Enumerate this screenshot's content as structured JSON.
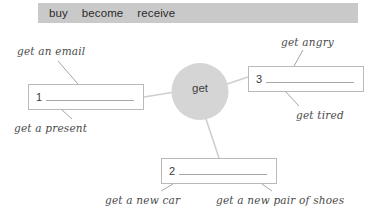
{
  "worksheet": {
    "wordbank": {
      "words": [
        "buy",
        "become",
        "receive"
      ]
    },
    "center_node": {
      "label": "get"
    },
    "answer_boxes": [
      {
        "number": "1",
        "value": ""
      },
      {
        "number": "2",
        "value": ""
      },
      {
        "number": "3",
        "value": ""
      }
    ],
    "annotations": [
      {
        "id": "get-an-email",
        "text": "get an email"
      },
      {
        "id": "get-a-present",
        "text": "get a present"
      },
      {
        "id": "get-angry",
        "text": "get angry"
      },
      {
        "id": "get-tired",
        "text": "get tired"
      },
      {
        "id": "get-a-new-car",
        "text": "get a new car"
      },
      {
        "id": "get-a-new-pair-of-shoes",
        "text": "get a new pair of shoes"
      }
    ],
    "colors": {
      "wordbank_background": "#c9c9c9",
      "node_fill": "#d5d5d5",
      "box_border": "#b9b9b9",
      "connector": "#cfcfcf",
      "leader": "#9a9a9a",
      "text": "#3a3a3a",
      "page_background": "#ffffff"
    }
  }
}
